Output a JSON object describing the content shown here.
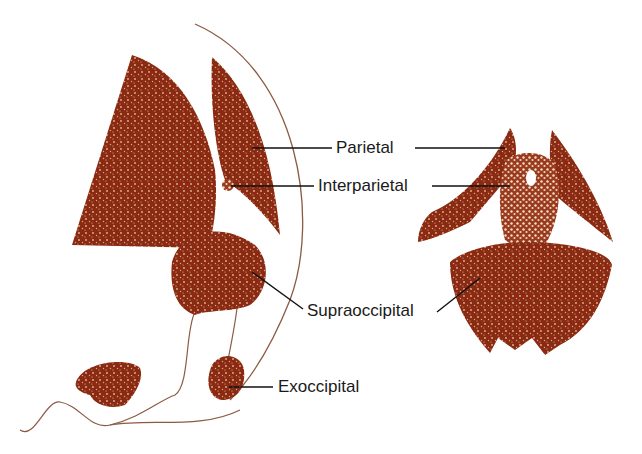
{
  "figure": {
    "bone_color": "#8b2a12",
    "outline_color": "#8b5a40",
    "leader_color": "#111111",
    "labels": {
      "parietal": "Parietal",
      "interparietal": "Interparietal",
      "supraoccipital": "Supraoccipital",
      "exoccipital": "Exoccipital"
    },
    "views": [
      {
        "name": "lateral-view",
        "parts": [
          "parietal",
          "interparietal",
          "supraoccipital",
          "exoccipital"
        ]
      },
      {
        "name": "posterior-view",
        "parts": [
          "parietal",
          "interparietal",
          "supraoccipital"
        ]
      }
    ]
  }
}
